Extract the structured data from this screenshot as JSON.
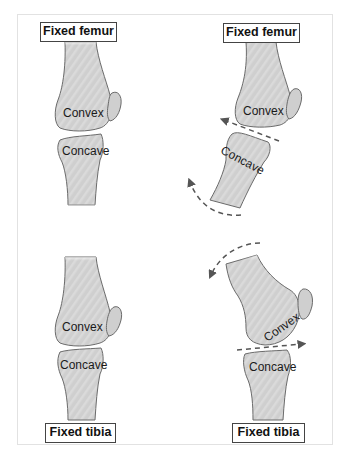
{
  "panels": [
    {
      "id": "top-left",
      "fixed_label": "Fixed femur",
      "upper_bone_label": "Convex",
      "lower_bone_label": "Concave"
    },
    {
      "id": "top-right",
      "fixed_label": "Fixed femur",
      "upper_bone_label": "Convex",
      "lower_bone_label": "Concave"
    },
    {
      "id": "bottom-left",
      "fixed_label": "Fixed tibia",
      "upper_bone_label": "Convex",
      "lower_bone_label": "Concave"
    },
    {
      "id": "bottom-right",
      "fixed_label": "Fixed tibia",
      "upper_bone_label": "Convex",
      "lower_bone_label": "Concave"
    }
  ],
  "colors": {
    "bone_fill": "#c9c9c9",
    "bone_stroke": "#6b6b6b",
    "arrow": "#555555",
    "label_border": "#444444"
  }
}
